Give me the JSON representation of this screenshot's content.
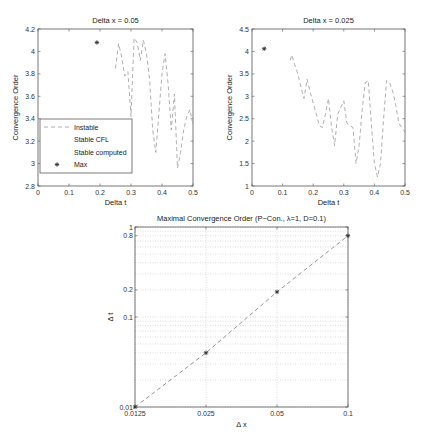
{
  "chart_data": [
    {
      "type": "line",
      "title": "Delta x = 0.05",
      "xlabel": "Delta t",
      "ylabel": "Convergence Order",
      "xlim": [
        0,
        0.5
      ],
      "ylim": [
        2.8,
        4.2
      ],
      "xticks": [
        "0",
        "0.1",
        "0.2",
        "0.3",
        "0.4",
        "0.5"
      ],
      "yticks": [
        "2.8",
        "3",
        "3.2",
        "3.4",
        "3.6",
        "3.8",
        "4",
        "4.2"
      ],
      "grid": false,
      "legend": {
        "position": "lower left",
        "entries": [
          "Instable",
          "Stable CFL",
          "Stable computed",
          "Max"
        ]
      },
      "series": [
        {
          "name": "Instable",
          "style": "dashed",
          "x": [
            0.25,
            0.26,
            0.27,
            0.28,
            0.29,
            0.3,
            0.31,
            0.32,
            0.33,
            0.34,
            0.35,
            0.36,
            0.37,
            0.38,
            0.39,
            0.4,
            0.41,
            0.42,
            0.43,
            0.44,
            0.45,
            0.46,
            0.47,
            0.48,
            0.49,
            0.5
          ],
          "y": [
            3.85,
            4.07,
            3.95,
            3.78,
            3.82,
            3.42,
            4.12,
            4.08,
            3.92,
            4.1,
            3.98,
            3.75,
            3.3,
            3.1,
            3.45,
            3.8,
            3.98,
            3.7,
            3.3,
            3.62,
            2.96,
            3.1,
            3.3,
            3.42,
            3.48,
            3.35
          ]
        },
        {
          "name": "Max",
          "style": "marker-star",
          "x": [
            0.19
          ],
          "y": [
            4.08
          ]
        }
      ]
    },
    {
      "type": "line",
      "title": "Delta x = 0.025",
      "xlabel": "Delta t",
      "ylabel": "Convergence Order",
      "xlim": [
        0,
        0.5
      ],
      "ylim": [
        1,
        4.5
      ],
      "xticks": [
        "0",
        "0.1",
        "0.2",
        "0.3",
        "0.4",
        "0.5"
      ],
      "yticks": [
        "1",
        "1.5",
        "2",
        "2.5",
        "3",
        "3.5",
        "4",
        "4.5"
      ],
      "grid": false,
      "series": [
        {
          "name": "Instable",
          "style": "dashed",
          "x": [
            0.125,
            0.13,
            0.14,
            0.15,
            0.16,
            0.17,
            0.18,
            0.19,
            0.2,
            0.21,
            0.22,
            0.23,
            0.24,
            0.25,
            0.26,
            0.27,
            0.28,
            0.29,
            0.3,
            0.31,
            0.32,
            0.33,
            0.34,
            0.35,
            0.36,
            0.37,
            0.38,
            0.39,
            0.4,
            0.41,
            0.42,
            0.43,
            0.44,
            0.45,
            0.46,
            0.47,
            0.48,
            0.49,
            0.5
          ],
          "y": [
            3.8,
            3.92,
            3.7,
            3.5,
            3.2,
            2.95,
            3.38,
            3.1,
            2.85,
            2.6,
            2.35,
            2.3,
            2.6,
            2.95,
            2.3,
            1.9,
            2.6,
            2.75,
            2.9,
            2.4,
            2.35,
            2.3,
            1.5,
            1.9,
            2.7,
            3.3,
            3.35,
            2.4,
            1.5,
            1.2,
            1.5,
            2.5,
            3.35,
            3.3,
            3.1,
            2.8,
            2.4,
            2.3,
            2.2
          ]
        },
        {
          "name": "Max",
          "style": "marker-star",
          "x": [
            0.04
          ],
          "y": [
            4.06
          ]
        }
      ]
    },
    {
      "type": "line",
      "title": "Maximal Convergence Order (P−Con., λ=1, D=0.1)",
      "xlabel": "Δ x",
      "ylabel": "Δ t",
      "xscale": "log",
      "yscale": "log",
      "xlim": [
        0.0125,
        0.1
      ],
      "ylim": [
        0.01,
        1
      ],
      "xticks": [
        "0.0125",
        "0.025",
        "0.05",
        "0.1"
      ],
      "yticks": [
        "0.01",
        "0.1",
        "0.2",
        "0.8",
        "1"
      ],
      "grid": true,
      "series": [
        {
          "name": "Max",
          "style": "dashed-marker",
          "x": [
            0.0125,
            0.025,
            0.05,
            0.1
          ],
          "y": [
            0.01,
            0.04,
            0.19,
            0.8
          ]
        }
      ]
    }
  ]
}
